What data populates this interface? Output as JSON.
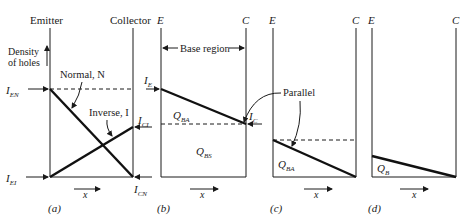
{
  "figure": {
    "panels": [
      {
        "id": "a",
        "caption": "(a)",
        "left_label": "Emitter",
        "right_label": "Collector",
        "y_axis_label_line1": "Density",
        "y_axis_label_line2": "of holes",
        "labels": {
          "ien": "I",
          "ien_sub": "EN",
          "iei": "I",
          "iei_sub": "EI",
          "ici": "I",
          "ici_sub": "CI",
          "icn": "I",
          "icn_sub": "CN",
          "normal": "Normal, N",
          "inverse": "Inverse, I"
        },
        "x_label": "x"
      },
      {
        "id": "b",
        "caption": "(b)",
        "left_label": "E",
        "right_label": "C",
        "base_region": "Base region",
        "labels": {
          "ie": "I",
          "ie_sub": "E",
          "ic": "I",
          "ic_sub": "C",
          "qba": "Q",
          "qba_sub": "BA",
          "qbs": "Q",
          "qbs_sub": "BS"
        },
        "x_label": "x"
      },
      {
        "id": "c",
        "caption": "(c)",
        "left_label": "E",
        "right_label": "C",
        "labels": {
          "parallel": "Parallel",
          "qba": "Q",
          "qba_sub": "BA"
        },
        "x_label": "x"
      },
      {
        "id": "d",
        "caption": "(d)",
        "left_label": "E",
        "right_label": "C",
        "labels": {
          "qb": "Q",
          "qb_sub": "B"
        },
        "x_label": "x"
      }
    ]
  }
}
